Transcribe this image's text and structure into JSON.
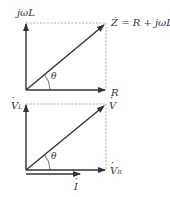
{
  "diagrams": [
    {
      "title": "impedance-diagram",
      "vertical_label": "jωL",
      "horizontal_label": "R",
      "diagonal_label": "Ż = R + jωL",
      "angle_label": "θ"
    },
    {
      "title": "voltage-phasor-diagram",
      "vertical_label": "V",
      "vertical_sub": "L",
      "horizontal_label": "V",
      "horizontal_sub": "R",
      "diagonal_label": "V",
      "angle_label": "θ",
      "current_label": "I"
    }
  ],
  "colors": {
    "line": "#333333",
    "dashed": "#999999",
    "text": "#333333"
  }
}
